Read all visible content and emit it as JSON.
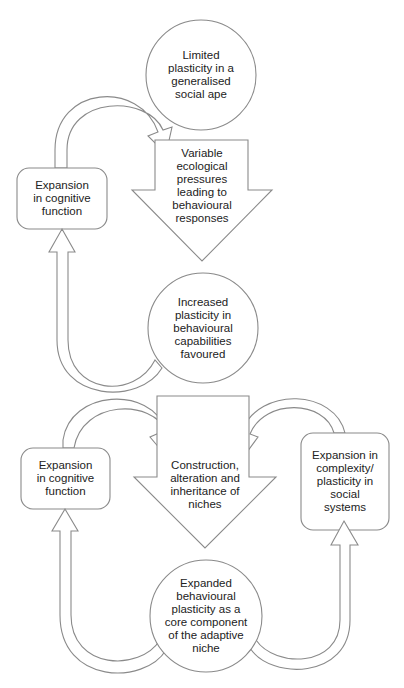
{
  "diagram": {
    "top_cycle": {
      "start_node": "Limited\nplasticity in a\ngeneralised\nsocial ape",
      "pressure_arrow": "Variable\necological\npressures\nleading to\nbehavioural\nresponses",
      "outcome_node": "Increased\nplasticity in\nbehavioural\ncapabilities\nfavoured",
      "feedback_box": "Expansion\nin cognitive\nfunction"
    },
    "bottom_cycle": {
      "niche_arrow": "Construction,\nalteration and\ninheritance of\nniches",
      "left_box": "Expansion\nin cognitive\nfunction",
      "right_box": "Expansion in\ncomplexity/\nplasticity in\nsocial\nsystems",
      "core_node": "Expanded\nbehavioural\nplasticity as a\ncore component\nof the adaptive\nniche"
    },
    "colors": {
      "stroke": "#8a8a8a",
      "fill": "#ffffff",
      "text": "#222222"
    }
  }
}
